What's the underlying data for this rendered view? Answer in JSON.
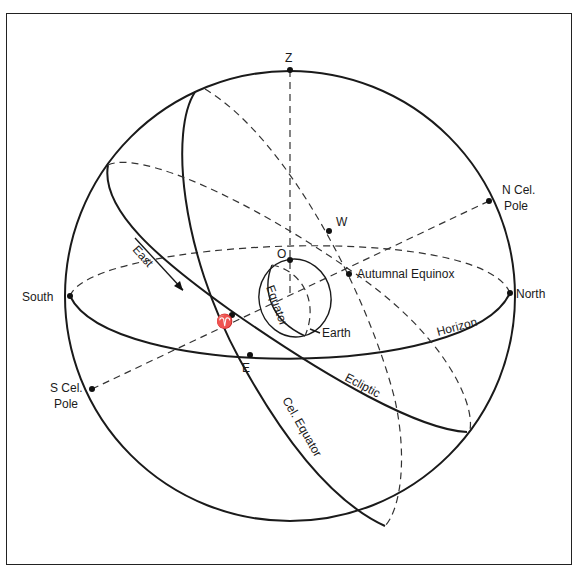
{
  "diagram": {
    "type": "celestial-sphere",
    "labels": {
      "zenith": "Z",
      "observer": "O",
      "west": "W",
      "east_point": "E",
      "north": "North",
      "south": "South",
      "n_cel_pole_1": "N Cel.",
      "n_cel_pole_2": "Pole",
      "s_cel_pole_1": "S Cel.",
      "s_cel_pole_2": "Pole",
      "autumnal_equinox": "Autumnal Equinox",
      "vernal_equinox_symbol": "♈",
      "earth": "Earth",
      "equator": "Equator",
      "horizon": "Horizon",
      "ecliptic": "Ecliptic",
      "cel_equator": "Cel. Equator",
      "east_arrow": "East"
    },
    "colors": {
      "line": "#1a1a1a",
      "background": "#ffffff"
    }
  }
}
